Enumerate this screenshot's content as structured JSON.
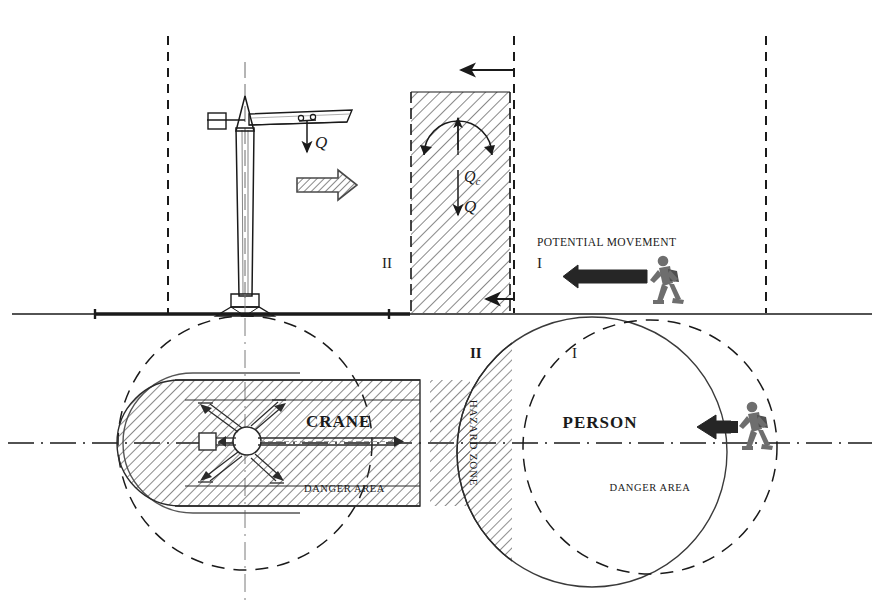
{
  "diagram": {
    "views": {
      "elevation": {
        "name": "elevation-view",
        "labels": {
          "load_q_top": "Q",
          "load_q_zone": "Q",
          "load_qc": "Qc",
          "qc_sub": "c",
          "zone_two": "II",
          "zone_one": "I",
          "potential_movement": "POTENTIAL MOVEMENT"
        }
      },
      "plan": {
        "name": "plan-view",
        "labels": {
          "crane": "CRANE",
          "person": "PERSON",
          "danger_area_left": "DANGER AREA",
          "danger_area_right": "DANGER AREA",
          "hazard_zone": "HAZARD ZONE",
          "zone_two": "II",
          "zone_one": "I"
        }
      }
    },
    "colors": {
      "ink": "#1a1a1a",
      "line": "#2b2b2b",
      "hatch": "#555555",
      "figure": "#6e6e6e",
      "figure_dark": "#4a4a4a",
      "arrow_dark": "#262626",
      "ground": "#1a1a1a"
    }
  }
}
